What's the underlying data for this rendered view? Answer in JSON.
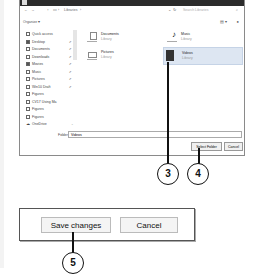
{
  "dialog": {
    "title": "Select Folder",
    "address": {
      "back": "←",
      "forward": "→",
      "up": "↑",
      "path": [
        "Libraries"
      ],
      "refresh": "↻",
      "search_placeholder": "Search Libraries",
      "search_icon": "⌕"
    },
    "toolbar": {
      "organize_label": "Organize ▾",
      "view_icon": "▤ ▾",
      "help_icon": "?"
    },
    "nav": {
      "items": [
        {
          "label": "Quick access",
          "pinned": false
        },
        {
          "label": "Desktop",
          "pinned": true
        },
        {
          "label": "Documents",
          "pinned": true
        },
        {
          "label": "Downloads",
          "pinned": true
        },
        {
          "label": "Movies",
          "pinned": true
        },
        {
          "label": "Music",
          "pinned": true
        },
        {
          "label": "Pictures",
          "pinned": true
        },
        {
          "label": "Win10 Draft",
          "pinned": true
        },
        {
          "label": "Figures",
          "pinned": false
        },
        {
          "label": "CV17 Using Ma",
          "pinned": false
        },
        {
          "label": "Figures",
          "pinned": false
        },
        {
          "label": "Figures",
          "pinned": false
        },
        {
          "label": "OneDrive",
          "pinned": false
        }
      ],
      "pin_glyph": "✐"
    },
    "libraries": [
      {
        "name": "Documents",
        "sub": "Library"
      },
      {
        "name": "Music",
        "sub": "Library"
      },
      {
        "name": "Pictures",
        "sub": "Library"
      },
      {
        "name": "Videos",
        "sub": "Library"
      }
    ],
    "folder_label": "Folder:",
    "folder_value": "Videos",
    "select_button": "Select Folder",
    "cancel_button": "Cancel"
  },
  "callouts": [
    "3",
    "4",
    "5"
  ],
  "settings_panel": {
    "save_button": "Save changes",
    "cancel_button": "Cancel"
  }
}
